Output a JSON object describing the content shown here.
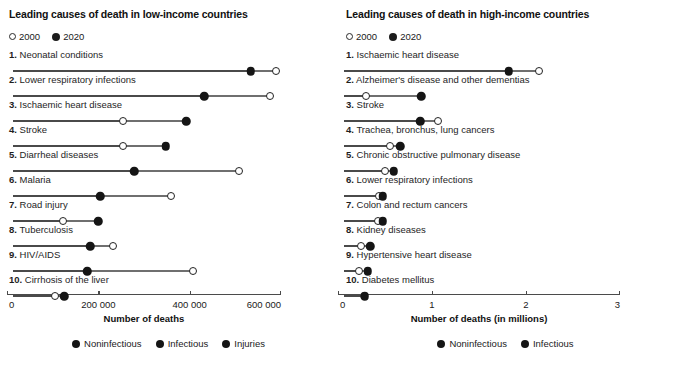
{
  "panels": [
    {
      "title": "Leading causes of death in low-income countries",
      "year_key": [
        {
          "label": "2000",
          "style": "open"
        },
        {
          "label": "2020",
          "style": "filled"
        }
      ],
      "axis": {
        "title": "Number of deaths",
        "ticks": [
          "0",
          "200 000",
          "400 000",
          "600 000"
        ],
        "min": 0,
        "max": 600000
      },
      "category_legend": [
        {
          "label": "Noninfectious",
          "color": "#151515"
        },
        {
          "label": "Infectious",
          "color": "#151515"
        },
        {
          "label": "Injuries",
          "color": "#151515"
        }
      ],
      "rows": [
        {
          "rank": "1.",
          "label": "Neonatal conditions",
          "v2000": 576000,
          "v2020": 521000,
          "category": "Infectious"
        },
        {
          "rank": "2.",
          "label": "Lower respiratory infections",
          "v2000": 563000,
          "v2020": 419000,
          "category": "Infectious"
        },
        {
          "rank": "3.",
          "label": "Ischaemic heart disease",
          "v2000": 241000,
          "v2020": 379000,
          "category": "Noninfectious"
        },
        {
          "rank": "4.",
          "label": "Stroke",
          "v2000": 241000,
          "v2020": 335000,
          "category": "Noninfectious"
        },
        {
          "rank": "5.",
          "label": "Diarrheal diseases",
          "v2000": 494000,
          "v2020": 266000,
          "category": "Infectious"
        },
        {
          "rank": "6.",
          "label": "Malaria",
          "v2000": 346000,
          "v2020": 191000,
          "category": "Infectious"
        },
        {
          "rank": "7.",
          "label": "Road injury",
          "v2000": 110000,
          "v2020": 187000,
          "category": "Injuries"
        },
        {
          "rank": "8.",
          "label": "Tuberculosis",
          "v2000": 220000,
          "v2020": 169000,
          "category": "Infectious"
        },
        {
          "rank": "9.",
          "label": "HIV/AIDS",
          "v2000": 394000,
          "v2020": 163000,
          "category": "Infectious"
        },
        {
          "rank": "10.",
          "label": "Cirrhosis of the liver",
          "v2000": 93000,
          "v2020": 112000,
          "category": "Noninfectious"
        }
      ]
    },
    {
      "title": "Leading causes of death in high-income countries",
      "year_key": [
        {
          "label": "2000",
          "style": "open"
        },
        {
          "label": "2020",
          "style": "filled"
        }
      ],
      "axis": {
        "title": "Number of deaths (in millions)",
        "ticks": [
          "0",
          "1",
          "2",
          "3"
        ],
        "min": 0,
        "max": 3
      },
      "category_legend": [
        {
          "label": "Noninfectious",
          "color": "#151515"
        },
        {
          "label": "Infectious",
          "color": "#151515"
        }
      ],
      "rows": [
        {
          "rank": "1.",
          "label": "Ischaemic heart disease",
          "v2000": 2.07,
          "v2020": 1.75,
          "category": "Noninfectious"
        },
        {
          "rank": "2.",
          "label": "Alzheimer's disease and other dementias",
          "v2000": 0.23,
          "v2020": 0.82,
          "category": "Noninfectious"
        },
        {
          "rank": "3.",
          "label": "Stroke",
          "v2000": 1.0,
          "v2020": 0.81,
          "category": "Noninfectious"
        },
        {
          "rank": "4.",
          "label": "Trachea, bronchus, lung cancers",
          "v2000": 0.49,
          "v2020": 0.6,
          "category": "Noninfectious"
        },
        {
          "rank": "5.",
          "label": "Chronic obstructive pulmonary disease",
          "v2000": 0.44,
          "v2020": 0.53,
          "category": "Noninfectious"
        },
        {
          "rank": "6.",
          "label": "Lower respiratory infections",
          "v2000": 0.37,
          "v2020": 0.41,
          "category": "Infectious"
        },
        {
          "rank": "7.",
          "label": "Colon and rectum cancers",
          "v2000": 0.36,
          "v2020": 0.41,
          "category": "Noninfectious"
        },
        {
          "rank": "8.",
          "label": "Kidney diseases",
          "v2000": 0.18,
          "v2020": 0.28,
          "category": "Noninfectious"
        },
        {
          "rank": "9.",
          "label": "Hypertensive heart disease",
          "v2000": 0.16,
          "v2020": 0.25,
          "category": "Noninfectious"
        },
        {
          "rank": "10.",
          "label": "Diabetes mellitus",
          "v2000": 0.21,
          "v2020": 0.22,
          "category": "Noninfectious"
        }
      ]
    }
  ],
  "chart_data": [
    {
      "type": "dumbbell",
      "title": "Leading causes of death in low-income countries",
      "xlabel": "Number of deaths",
      "ylabel": "",
      "xlim": [
        0,
        600000
      ],
      "xticks": [
        0,
        200000,
        400000,
        600000
      ],
      "xticklabels": [
        "0",
        "200 000",
        "400 000",
        "600 000"
      ],
      "grid": false,
      "legend": [
        "2000",
        "2020"
      ],
      "legend_position": "top-left",
      "category_legend": [
        "Noninfectious",
        "Infectious",
        "Injuries"
      ],
      "categories": [
        "1. Neonatal conditions",
        "2. Lower respiratory infections",
        "3. Ischaemic heart disease",
        "4. Stroke",
        "5. Diarrheal diseases",
        "6. Malaria",
        "7. Road injury",
        "8. Tuberculosis",
        "9. HIV/AIDS",
        "10. Cirrhosis of the liver"
      ],
      "series": [
        {
          "name": "2000",
          "marker": "open-circle",
          "values": [
            576000,
            563000,
            241000,
            241000,
            494000,
            346000,
            110000,
            220000,
            394000,
            93000
          ]
        },
        {
          "name": "2020",
          "marker": "filled-circle",
          "values": [
            521000,
            419000,
            379000,
            335000,
            266000,
            191000,
            187000,
            169000,
            163000,
            112000
          ]
        }
      ],
      "point_categories": [
        "Infectious",
        "Infectious",
        "Noninfectious",
        "Noninfectious",
        "Infectious",
        "Infectious",
        "Injuries",
        "Infectious",
        "Infectious",
        "Noninfectious"
      ]
    },
    {
      "type": "dumbbell",
      "title": "Leading causes of death in high-income countries",
      "xlabel": "Number of deaths (in millions)",
      "ylabel": "",
      "xlim": [
        0,
        3
      ],
      "xticks": [
        0,
        1,
        2,
        3
      ],
      "xticklabels": [
        "0",
        "1",
        "2",
        "3"
      ],
      "grid": false,
      "legend": [
        "2000",
        "2020"
      ],
      "legend_position": "top-left",
      "category_legend": [
        "Noninfectious",
        "Infectious"
      ],
      "categories": [
        "1. Ischaemic heart disease",
        "2. Alzheimer's disease and other dementias",
        "3. Stroke",
        "4. Trachea, bronchus, lung cancers",
        "5. Chronic obstructive pulmonary disease",
        "6. Lower respiratory infections",
        "7. Colon and rectum cancers",
        "8. Kidney diseases",
        "9. Hypertensive heart disease",
        "10. Diabetes mellitus"
      ],
      "series": [
        {
          "name": "2000",
          "marker": "open-circle",
          "values": [
            2.07,
            0.23,
            1.0,
            0.49,
            0.44,
            0.37,
            0.36,
            0.18,
            0.16,
            0.21
          ]
        },
        {
          "name": "2020",
          "marker": "filled-circle",
          "values": [
            1.75,
            0.82,
            0.81,
            0.6,
            0.53,
            0.41,
            0.41,
            0.28,
            0.25,
            0.22
          ]
        }
      ],
      "point_categories": [
        "Noninfectious",
        "Noninfectious",
        "Noninfectious",
        "Noninfectious",
        "Noninfectious",
        "Infectious",
        "Noninfectious",
        "Noninfectious",
        "Noninfectious",
        "Noninfectious"
      ]
    }
  ]
}
